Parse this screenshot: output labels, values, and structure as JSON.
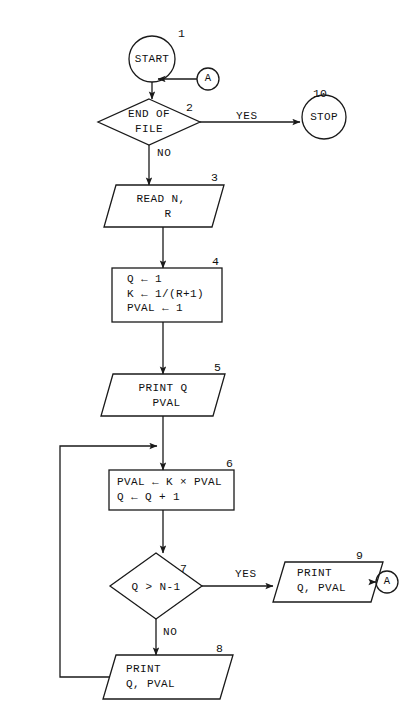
{
  "diagram": {
    "type": "flowchart",
    "nodes": [
      {
        "id": "start",
        "step": "1",
        "shape": "terminal-circle",
        "text": "START",
        "cx": 152,
        "cy": 59,
        "r": 23
      },
      {
        "id": "connector_in_a",
        "step": "",
        "shape": "connector-circle",
        "text": "A",
        "cx": 208,
        "cy": 79,
        "r": 11
      },
      {
        "id": "end_of_file",
        "step": "2",
        "shape": "decision",
        "text": "END OF\nFILE",
        "cx": 149,
        "cy": 122,
        "w": 102,
        "h": 46
      },
      {
        "id": "stop",
        "step": "10",
        "shape": "terminal-circle",
        "text": "STOP",
        "cx": 324,
        "cy": 117,
        "r": 22
      },
      {
        "id": "read",
        "step": "3",
        "shape": "io-parallelogram",
        "text": "READ N,\n  R",
        "x": 104,
        "y": 185,
        "w": 120,
        "h": 42
      },
      {
        "id": "init",
        "step": "4",
        "shape": "process",
        "text": "Q ← 1\nK ← 1/(R+1)\nPVAL ← 1",
        "x": 112,
        "y": 268,
        "w": 110,
        "h": 54
      },
      {
        "id": "print_first",
        "step": "5",
        "shape": "io-parallelogram",
        "text": "PRINT Q\n PVAL",
        "x": 101,
        "y": 374,
        "w": 124,
        "h": 42
      },
      {
        "id": "compute",
        "step": "6",
        "shape": "process",
        "text": "PVAL ← K × PVAL\nQ ← Q + 1",
        "x": 109,
        "y": 470,
        "w": 125,
        "h": 40
      },
      {
        "id": "loop_test",
        "step": "7",
        "shape": "decision",
        "text": "Q > N-1",
        "cx": 156,
        "cy": 586,
        "w": 92,
        "h": 66
      },
      {
        "id": "print_last",
        "step": "9",
        "shape": "io-parallelogram",
        "text": "PRINT\nQ, PVAL",
        "x": 273,
        "y": 562,
        "w": 110,
        "h": 40
      },
      {
        "id": "connector_out_a",
        "step": "",
        "shape": "connector-circle",
        "text": "A",
        "cx": 387,
        "cy": 582,
        "r": 11
      },
      {
        "id": "print_loop",
        "step": "8",
        "shape": "io-parallelogram",
        "text": "PRINT\nQ, PVAL",
        "x": 103,
        "y": 655,
        "w": 130,
        "h": 44
      }
    ],
    "branch_labels": [
      {
        "id": "eof_yes",
        "text": "YES",
        "x": 236,
        "y": 109
      },
      {
        "id": "eof_no",
        "text": "NO",
        "x": 157,
        "y": 146
      },
      {
        "id": "loop_yes",
        "text": "YES",
        "x": 235,
        "y": 567
      },
      {
        "id": "loop_no",
        "text": "NO",
        "x": 163,
        "y": 625
      }
    ],
    "step_numbers": [
      {
        "id": "num_1",
        "text": "1",
        "x": 178,
        "y": 26
      },
      {
        "id": "num_2",
        "text": "2",
        "x": 186,
        "y": 100
      },
      {
        "id": "num_10",
        "text": "10",
        "x": 313,
        "y": 86
      },
      {
        "id": "num_3",
        "text": "3",
        "x": 211,
        "y": 184
      },
      {
        "id": "num_4",
        "text": "4",
        "x": 212,
        "y": 256
      },
      {
        "id": "num_5",
        "text": "5",
        "x": 214,
        "y": 372
      },
      {
        "id": "num_6",
        "text": "6",
        "x": 226,
        "y": 458
      },
      {
        "id": "num_7",
        "text": "7",
        "x": 180,
        "y": 561
      },
      {
        "id": "num_9",
        "text": "9",
        "x": 356,
        "y": 551
      },
      {
        "id": "num_8",
        "text": "8",
        "x": 216,
        "y": 644
      }
    ],
    "colors": {
      "stroke": "#1a1a1a",
      "background": "#ffffff",
      "text": "#101010"
    }
  }
}
